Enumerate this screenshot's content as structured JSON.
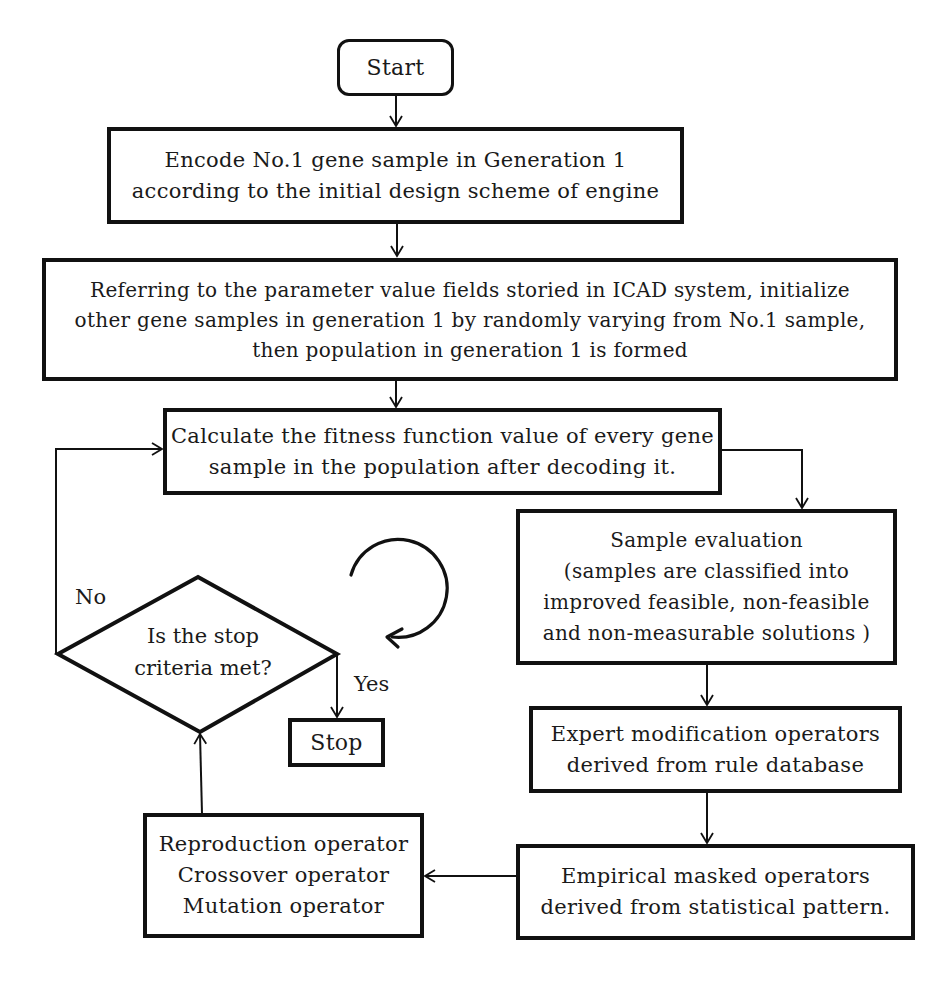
{
  "diagram": {
    "start": {
      "label": "Start"
    },
    "encode": {
      "lines": [
        "Encode No.1 gene sample in Generation 1",
        "according to the initial design scheme of engine"
      ]
    },
    "initialize": {
      "lines": [
        "Referring to the parameter value fields storied in ICAD system, initialize",
        "other gene samples in generation 1 by randomly varying from No.1 sample,",
        "then population in generation 1 is formed"
      ]
    },
    "fitness": {
      "lines": [
        "Calculate the fitness function value of every gene",
        "sample in the population after decoding it."
      ]
    },
    "evaluation": {
      "lines": [
        "Sample evaluation",
        "(samples are classified into",
        "improved feasible, non-feasible",
        "and  non-measurable  solutions )"
      ]
    },
    "expert": {
      "lines": [
        "Expert modification operators",
        "derived from rule database"
      ]
    },
    "empirical": {
      "lines": [
        "Empirical masked operators",
        "derived from statistical pattern."
      ]
    },
    "operators": {
      "lines": [
        "Reproduction  operator",
        "Crossover  operator",
        "Mutation operator"
      ]
    },
    "decision": {
      "lines": [
        "Is the stop",
        "criteria met?"
      ],
      "no_label": "No",
      "yes_label": "Yes"
    },
    "stop": {
      "label": "Stop"
    },
    "loop_icon": "clockwise-circular-arrow"
  },
  "colors": {
    "stroke": "#111111",
    "background": "#ffffff"
  }
}
